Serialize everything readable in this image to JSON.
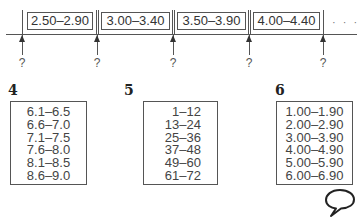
{
  "number_line": {
    "intervals": [
      "2.50–2.90",
      "3.00–3.40",
      "3.50–3.90",
      "4.00–4.40"
    ],
    "continuation": "· · ·",
    "boundary_markers": [
      "?",
      "?",
      "?",
      "?",
      "?"
    ]
  },
  "exercises": [
    {
      "number": "4",
      "intervals": [
        "6.1–6.5",
        "6.6–7.0",
        "7.1–7.5",
        "7.6–8.0",
        "8.1–8.5",
        "8.6–9.0"
      ]
    },
    {
      "number": "5",
      "intervals": [
        "1–12",
        "13–24",
        "25–36",
        "37–48",
        "49–60",
        "61–72"
      ]
    },
    {
      "number": "6",
      "intervals": [
        "1.00–1.90",
        "2.00–2.90",
        "3.00–3.90",
        "4.00–4.90",
        "5.00–5.90",
        "6.00–6.90"
      ]
    }
  ],
  "icons": {
    "speech_bubble": "speech-bubble-icon"
  }
}
